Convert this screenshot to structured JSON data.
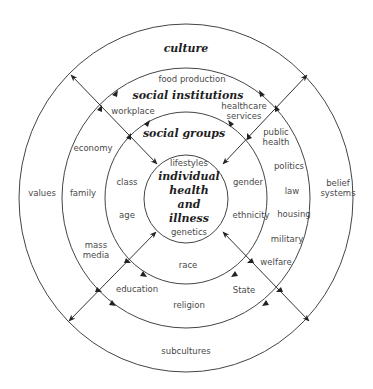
{
  "diagram": {
    "rings": {
      "culture": {
        "title": "culture",
        "items": [
          "values",
          "belief systems",
          "subcultures"
        ]
      },
      "social_institutions": {
        "title": "social institutions",
        "items": [
          "food production",
          "workplace",
          "healthcare services",
          "economy",
          "family",
          "mass media",
          "education",
          "religion",
          "State",
          "welfare",
          "military",
          "housing",
          "law",
          "politics",
          "public health"
        ]
      },
      "social_groups": {
        "title": "social groups",
        "items": [
          "class",
          "age",
          "race",
          "ethnicity",
          "gender"
        ]
      },
      "center": {
        "title_lines": [
          "individual",
          "health",
          "and",
          "illness"
        ],
        "items": [
          "lifestyles",
          "genetics"
        ]
      }
    },
    "labels": {
      "culture": "culture",
      "values": "values",
      "belief": "belief",
      "systems": "systems",
      "subcultures": "subcultures",
      "social_institutions": "social institutions",
      "food_production": "food production",
      "workplace": "workplace",
      "healthcare": "healthcare",
      "services": "services",
      "economy": "economy",
      "family": "family",
      "mass": "mass",
      "media": "media",
      "education": "education",
      "religion": "religion",
      "state": "State",
      "welfare": "welfare",
      "military": "military",
      "housing": "housing",
      "law": "law",
      "politics": "politics",
      "public": "public",
      "health": "health",
      "social_groups": "social groups",
      "class": "class",
      "age": "age",
      "race": "race",
      "ethnicity": "ethnicity",
      "gender": "gender",
      "lifestyles": "lifestyles",
      "genetics": "genetics",
      "center_1": "individual",
      "center_2": "health",
      "center_3": "and",
      "center_4": "illness"
    },
    "colors": {
      "line": "#3a3a3a",
      "text": "#4a4a4a",
      "title": "#1e1e1e"
    }
  }
}
